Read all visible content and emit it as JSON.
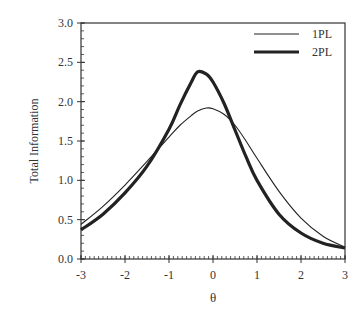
{
  "chart_data": {
    "type": "line",
    "title": "",
    "xlabel": "θ",
    "ylabel": "Total Information",
    "xlim": [
      -3,
      3
    ],
    "ylim": [
      0,
      3.0
    ],
    "xticks": [
      "-3",
      "-2",
      "-1",
      "0",
      "1",
      "2",
      "3"
    ],
    "yticks": [
      "0.0",
      "0.5",
      "1.0",
      "1.5",
      "2.0",
      "2.5",
      "3.0"
    ],
    "grid": false,
    "legend_position": "upper right",
    "x": [
      -3.0,
      -2.5,
      -2.0,
      -1.5,
      -1.0,
      -0.75,
      -0.5,
      -0.35,
      -0.15,
      0.0,
      0.25,
      0.5,
      0.75,
      1.0,
      1.5,
      2.0,
      2.5,
      3.0
    ],
    "series": [
      {
        "name": "1PL",
        "style": "thin",
        "values": [
          0.44,
          0.67,
          0.94,
          1.24,
          1.55,
          1.7,
          1.82,
          1.88,
          1.92,
          1.91,
          1.84,
          1.7,
          1.5,
          1.28,
          0.86,
          0.52,
          0.29,
          0.15
        ]
      },
      {
        "name": "2PL",
        "style": "thick",
        "values": [
          0.37,
          0.57,
          0.84,
          1.18,
          1.65,
          1.96,
          2.24,
          2.38,
          2.35,
          2.25,
          1.98,
          1.64,
          1.3,
          1.0,
          0.57,
          0.33,
          0.2,
          0.14
        ]
      }
    ]
  }
}
